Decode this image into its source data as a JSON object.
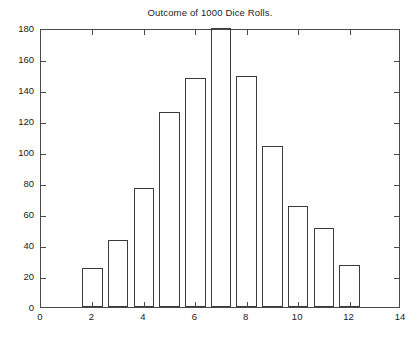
{
  "chart_data": {
    "type": "bar",
    "title": "Outcome of 1000 Dice Rolls.",
    "xlabel": "",
    "ylabel": "",
    "categories": [
      2,
      3,
      4,
      5,
      6,
      7,
      8,
      9,
      10,
      11,
      12
    ],
    "values": [
      25,
      43,
      77,
      126,
      148,
      180,
      149,
      104,
      65,
      51,
      27
    ],
    "xlim": [
      0,
      14
    ],
    "ylim": [
      0,
      180
    ],
    "xticks": [
      0,
      2,
      4,
      6,
      8,
      10,
      12,
      14
    ],
    "yticks": [
      0,
      20,
      40,
      60,
      80,
      100,
      120,
      140,
      160,
      180
    ],
    "xtick_labels": [
      "0",
      "2",
      "4",
      "6",
      "8",
      "10",
      "12",
      "14"
    ],
    "ytick_labels": [
      "0",
      "20",
      "40",
      "60",
      "80",
      "100",
      "120",
      "140",
      "160",
      "180"
    ],
    "grid": false,
    "legend": null,
    "bar_width": 0.8,
    "bar_fill": "none",
    "bar_edge_color": "#3a3a3a",
    "axis_color": "#4a4a4a",
    "background_color": "#ffffff"
  }
}
